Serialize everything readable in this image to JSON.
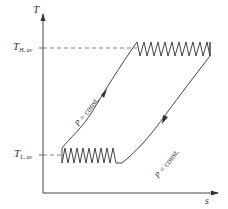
{
  "diagram": {
    "type": "T-s diagram",
    "axes": {
      "y_label": "T",
      "x_label": "s"
    },
    "levels": {
      "high": {
        "symbol": "T",
        "subscript": "H, av"
      },
      "low": {
        "symbol": "T",
        "subscript": "L, av"
      }
    },
    "processes": {
      "heating_curve_label": {
        "var": "P",
        "rest": " = const."
      },
      "cooling_curve_label": {
        "var": "P",
        "rest": " = const."
      }
    },
    "colors": {
      "line": "#444444",
      "dashed": "#666666",
      "background": "#ffffff"
    }
  }
}
